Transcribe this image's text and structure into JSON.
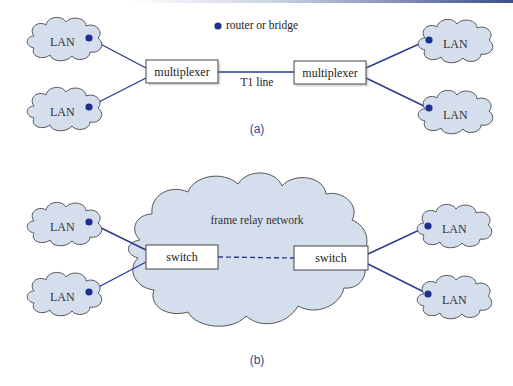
{
  "colors": {
    "link": "#2b3a8c",
    "node": "#1f2f8f",
    "cloud_fill": "#d5deec",
    "cloud_stroke": "#555555",
    "caption": "#2b4aa0"
  },
  "legend": {
    "label": "router or bridge",
    "icon": "filled-dot"
  },
  "diagram_a": {
    "caption": "(a)",
    "lans": [
      "LAN",
      "LAN",
      "LAN",
      "LAN"
    ],
    "left_box": "multiplexer",
    "right_box": "multiplexer",
    "link_label": "T1 line"
  },
  "diagram_b": {
    "caption": "(b)",
    "network_label": "frame relay network",
    "lans": [
      "LAN",
      "LAN",
      "LAN",
      "LAN"
    ],
    "left_box": "switch",
    "right_box": "switch"
  }
}
